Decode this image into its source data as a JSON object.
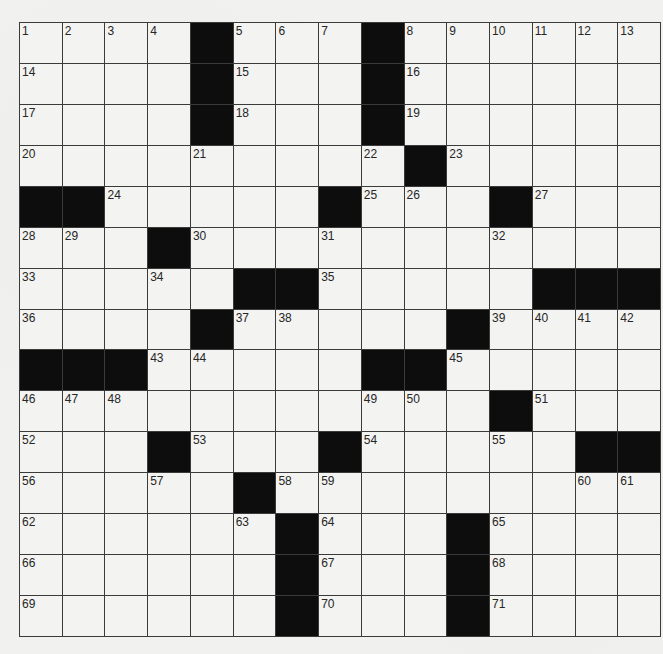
{
  "puzzle": {
    "rows": 15,
    "cols": 15,
    "colors": {
      "background": "#f1f1ef",
      "cell": "#f3f3f1",
      "block": "#0d0d0d",
      "line": "#3a3a3a",
      "number": "#262626"
    },
    "grid": [
      [
        "1",
        "2",
        "3",
        "4",
        "#",
        "5",
        "6",
        "7",
        "#",
        "8",
        "9",
        "10",
        "11",
        "12",
        "13"
      ],
      [
        "14",
        "",
        "",
        "",
        "#",
        "15",
        "",
        "",
        "#",
        "16",
        "",
        "",
        "",
        "",
        ""
      ],
      [
        "17",
        "",
        "",
        "",
        "#",
        "18",
        "",
        "",
        "#",
        "19",
        "",
        "",
        "",
        "",
        ""
      ],
      [
        "20",
        "",
        "",
        "",
        "21",
        "",
        "",
        "",
        "22",
        "#",
        "23",
        "",
        "",
        "",
        ""
      ],
      [
        "#",
        "#",
        "24",
        "",
        "",
        "",
        "",
        "#",
        "25",
        "26",
        "",
        "#",
        "27",
        "",
        ""
      ],
      [
        "28",
        "29",
        "",
        "#",
        "30",
        "",
        "",
        "31",
        "",
        "",
        "",
        "32",
        "",
        "",
        ""
      ],
      [
        "33",
        "",
        "",
        "34",
        "",
        "#",
        "#",
        "35",
        "",
        "",
        "",
        "",
        "#",
        "#",
        "#"
      ],
      [
        "36",
        "",
        "",
        "",
        "#",
        "37",
        "38",
        "",
        "",
        "",
        "#",
        "39",
        "40",
        "41",
        "42"
      ],
      [
        "#",
        "#",
        "#",
        "43",
        "44",
        "",
        "",
        "",
        "#",
        "#",
        "45",
        "",
        "",
        "",
        ""
      ],
      [
        "46",
        "47",
        "48",
        "",
        "",
        "",
        "",
        "",
        "49",
        "50",
        "",
        "#",
        "51",
        "",
        ""
      ],
      [
        "52",
        "",
        "",
        "#",
        "53",
        "",
        "",
        "#",
        "54",
        "",
        "",
        "55",
        "",
        "#",
        "#"
      ],
      [
        "56",
        "",
        "",
        "57",
        "",
        "#",
        "58",
        "59",
        "",
        "",
        "",
        "",
        "",
        "60",
        "61"
      ],
      [
        "62",
        "",
        "",
        "",
        "",
        "63",
        "#",
        "64",
        "",
        "",
        "#",
        "65",
        "",
        "",
        ""
      ],
      [
        "66",
        "",
        "",
        "",
        "",
        "",
        "#",
        "67",
        "",
        "",
        "#",
        "68",
        "",
        "",
        ""
      ],
      [
        "69",
        "",
        "",
        "",
        "",
        "",
        "#",
        "70",
        "",
        "",
        "#",
        "71",
        "",
        "",
        ""
      ]
    ],
    "entries": {}
  }
}
